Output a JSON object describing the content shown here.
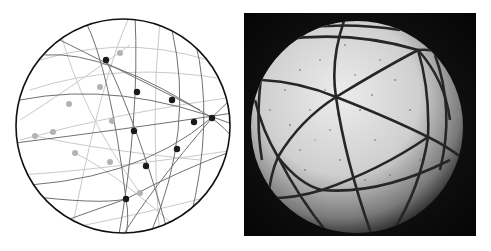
{
  "figure": {
    "left_panel": {
      "kind": "diagram",
      "description": "Sphere with intersecting great circles; front-side vertices in dark, back-side vertices in grey",
      "outline_color": "#111111",
      "front_line_color": "#6e6e6e",
      "back_line_color": "#c4c4c4",
      "front_vertex_color": "#1a1a1a",
      "back_vertex_color": "#b0b0b0",
      "front_vertices": [
        {
          "x": 106,
          "y": 60
        },
        {
          "x": 137,
          "y": 92
        },
        {
          "x": 172,
          "y": 100
        },
        {
          "x": 194,
          "y": 122
        },
        {
          "x": 212,
          "y": 118
        },
        {
          "x": 134,
          "y": 131
        },
        {
          "x": 177,
          "y": 149
        },
        {
          "x": 146,
          "y": 166
        },
        {
          "x": 126,
          "y": 199
        }
      ],
      "back_vertices": [
        {
          "x": 120,
          "y": 53
        },
        {
          "x": 100,
          "y": 87
        },
        {
          "x": 69,
          "y": 104
        },
        {
          "x": 35,
          "y": 136
        },
        {
          "x": 53,
          "y": 132
        },
        {
          "x": 112,
          "y": 121
        },
        {
          "x": 75,
          "y": 153
        },
        {
          "x": 110,
          "y": 162
        },
        {
          "x": 140,
          "y": 193
        }
      ]
    },
    "right_panel": {
      "kind": "photograph",
      "description": "Speckled white ball with dark great-circle bands on black background",
      "background_color": "#0b0b0b",
      "ball_color": "#d8d8d8",
      "band_color": "#2a2a2a"
    }
  }
}
